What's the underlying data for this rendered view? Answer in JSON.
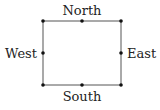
{
  "diagram": {
    "type": "rectangle-with-compass-labels",
    "labels": {
      "north": "North",
      "south": "South",
      "east": "East",
      "west": "West"
    },
    "rect": {
      "x1": 43,
      "y1": 21,
      "x2": 121,
      "y2": 85
    },
    "points": [
      {
        "name": "top-left",
        "x": 43,
        "y": 21
      },
      {
        "name": "top-mid",
        "x": 82,
        "y": 21
      },
      {
        "name": "top-right",
        "x": 121,
        "y": 21
      },
      {
        "name": "mid-left",
        "x": 43,
        "y": 53
      },
      {
        "name": "mid-right",
        "x": 121,
        "y": 53
      },
      {
        "name": "bottom-left",
        "x": 43,
        "y": 85
      },
      {
        "name": "bottom-mid",
        "x": 82,
        "y": 85
      },
      {
        "name": "bottom-right",
        "x": 121,
        "y": 85
      }
    ],
    "colors": {
      "line": "#555555",
      "dot": "#111111",
      "text": "#222222"
    }
  }
}
